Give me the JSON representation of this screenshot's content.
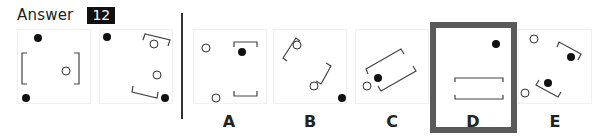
{
  "header": {
    "label": "Answer",
    "question_number": "12"
  },
  "colors": {
    "badge_bg": "#111111",
    "selected_border": "#5a5a5a",
    "divider": "#333333"
  },
  "sequence": [
    {
      "name": "sequence-panel-1"
    },
    {
      "name": "sequence-panel-2"
    }
  ],
  "options": [
    {
      "label": "A",
      "selected": false
    },
    {
      "label": "B",
      "selected": false
    },
    {
      "label": "C",
      "selected": false
    },
    {
      "label": "D",
      "selected": true
    },
    {
      "label": "E",
      "selected": false
    }
  ]
}
